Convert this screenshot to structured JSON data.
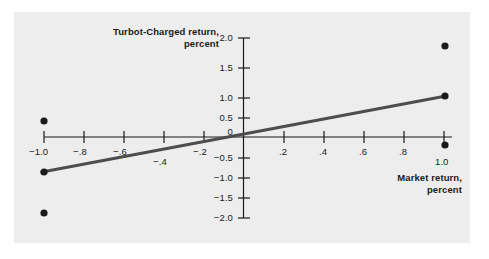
{
  "figure": {
    "background_color": "#ffffff",
    "panel_color": "#ededed",
    "ink_color": "#1a1a1a",
    "line_color": "#4d4d4d"
  },
  "chart_data": {
    "type": "scatter",
    "title": "",
    "xlabel": "Market return,\npercent",
    "xlabel_line1": "Market return,",
    "xlabel_line2": "percent",
    "ylabel": "Turbot-Charged return,\npercent",
    "ylabel_line1": "Turbot-Charged return,",
    "ylabel_line2": "percent",
    "xlim": [
      -1.1,
      1.12
    ],
    "ylim": [
      -2.1,
      2.1
    ],
    "grid": false,
    "legend": "none",
    "xticks": [
      -1.0,
      -0.8,
      -0.6,
      -0.4,
      -0.2,
      0.2,
      0.4,
      0.6,
      0.8,
      1.0
    ],
    "xtick_labels": [
      "−1.0",
      "−.8",
      "−.6",
      "−.4",
      "−.2",
      ".2",
      ".4",
      ".6",
      ".8",
      "1.0"
    ],
    "yticks": [
      2.0,
      1.5,
      1.0,
      0.5,
      0,
      -0.5,
      -1.0,
      -1.5,
      -2.0
    ],
    "ytick_labels": [
      "2.0",
      "1.5",
      "1.0",
      "0.5",
      "0",
      "−0.5",
      "−1.0",
      "−1.5",
      "−2.0"
    ],
    "series": [
      {
        "name": "observations",
        "marker": "filled-circle",
        "points": [
          {
            "x": -1.0,
            "y": 0.1
          },
          {
            "x": -1.0,
            "y": -0.6
          },
          {
            "x": -1.0,
            "y": -1.75
          },
          {
            "x": 1.0,
            "y": 1.78
          },
          {
            "x": 1.0,
            "y": 0.68
          },
          {
            "x": 1.0,
            "y": -0.05
          }
        ]
      },
      {
        "name": "fitted-line",
        "type": "line",
        "endpoints": [
          {
            "x": -1.0,
            "y": -0.6
          },
          {
            "x": 1.0,
            "y": 0.68
          }
        ],
        "slope": 0.64,
        "intercept": 0.04
      }
    ]
  }
}
